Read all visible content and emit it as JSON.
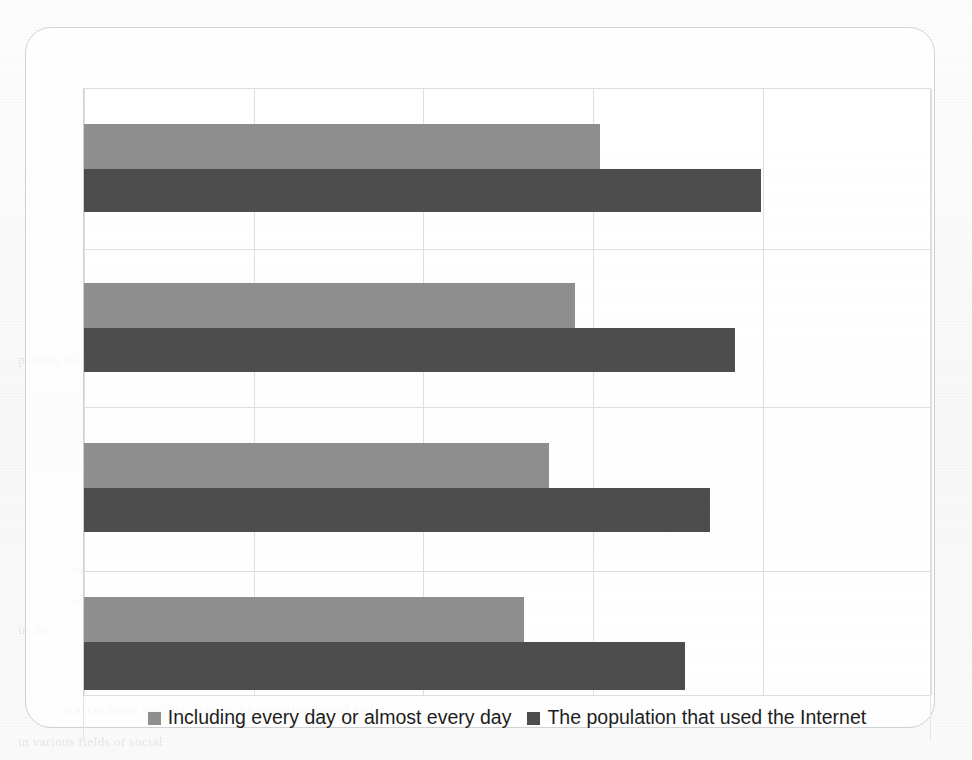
{
  "chart": {
    "legend": [
      {
        "label": "Including every day or almost every day",
        "color": "#8e8e8e",
        "swatch_name": "legend-swatch-light"
      },
      {
        "label": "The population that used the Internet",
        "color": "#4d4d4d",
        "swatch_name": "legend-swatch-dark"
      }
    ]
  },
  "chart_data": {
    "type": "bar",
    "orientation": "horizontal",
    "title": "",
    "subtitle": "",
    "xlabel": "",
    "ylabel": "",
    "categories": [
      "Group 1",
      "Group 2",
      "Group 3",
      "Group 4"
    ],
    "xlim": [
      0,
      100
    ],
    "xticks": [
      0,
      20,
      40,
      60,
      80,
      100
    ],
    "xticklabels": [
      "",
      "",
      "",
      "",
      "",
      ""
    ],
    "yticklabels": [
      "",
      "",
      "",
      ""
    ],
    "grid": "vertical-and-horizontal",
    "legend_position": "bottom",
    "series": [
      {
        "name": "Including every day or almost every day",
        "color": "#8e8e8e",
        "values": [
          61,
          58,
          55,
          52
        ]
      },
      {
        "name": "The population that used the Internet",
        "color": "#4d4d4d",
        "values": [
          80,
          77,
          74,
          71
        ]
      }
    ]
  },
  "page_background": {
    "ghost_text": [
      "percent relative to the same period of the previous year",
      "than in",
      "the same period.",
      "in the reporting period and the necessary measures to prevent",
      "and keep the scheduled and telec",
      "in the",
      "in accordance with the plan of the reporting period and",
      "in various fields of social"
    ]
  }
}
